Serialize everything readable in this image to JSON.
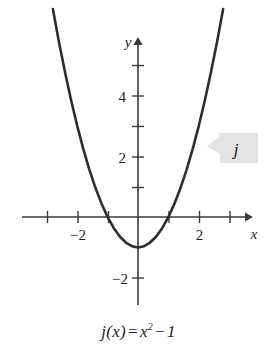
{
  "chart_data": {
    "type": "line",
    "title": "",
    "subtitle": "",
    "function_label": "j",
    "equation_plain": "j(x) = x^2 - 1",
    "equation_parts": {
      "fname": "j",
      "open_paren": "(",
      "var": "x",
      "close_paren": ")",
      "equals": "=",
      "term_var": "x",
      "exponent": "2",
      "minus": "−",
      "constant": "1"
    },
    "xlabel": "x",
    "ylabel": "y",
    "xlim": [
      -3.8,
      3.75
    ],
    "ylim": [
      -2.9,
      6.5
    ],
    "x_ticks": [
      -3,
      -2,
      -1,
      1,
      2,
      3
    ],
    "x_tick_labels": [
      "",
      "−2",
      "",
      "",
      "2",
      ""
    ],
    "y_ticks": [
      1,
      2,
      3,
      4,
      5,
      -1,
      -2
    ],
    "y_tick_labels": [
      "",
      "2",
      "",
      "4",
      "",
      "",
      "−2"
    ],
    "grid": false,
    "legend_position": "none",
    "axis_arrows": [
      "x-positive",
      "y-positive"
    ],
    "x_intercepts": [
      -1,
      1
    ],
    "y_intercept": -1,
    "vertex": [
      0,
      -1
    ],
    "x": [
      -2.8,
      -2.6,
      -2.4,
      -2.2,
      -2.0,
      -1.8,
      -1.6,
      -1.4,
      -1.2,
      -1.0,
      -0.8,
      -0.6,
      -0.4,
      -0.2,
      0.0,
      0.2,
      0.4,
      0.6,
      0.8,
      1.0,
      1.2,
      1.4,
      1.6,
      1.8,
      2.0,
      2.2,
      2.4,
      2.6,
      2.8
    ],
    "y": [
      6.84,
      5.76,
      4.76,
      3.84,
      3.0,
      2.24,
      1.56,
      0.96,
      0.44,
      0.0,
      -0.36,
      -0.64,
      -0.84,
      -0.96,
      -1.0,
      -0.96,
      -0.84,
      -0.64,
      -0.36,
      0.0,
      0.44,
      0.96,
      1.56,
      2.24,
      3.0,
      3.84,
      4.76,
      5.76,
      6.84
    ],
    "curve_color": "#2e2c2d",
    "axis_color": "#3a3839",
    "callout_fill": "#e2e2e2",
    "background": "#ffffff"
  },
  "callout": {
    "label": "j"
  }
}
